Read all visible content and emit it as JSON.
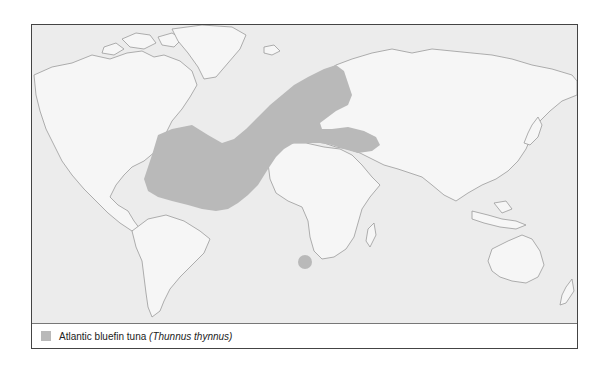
{
  "map": {
    "title": "Distribution map",
    "colors": {
      "ocean": "#ececec",
      "land": "#f6f6f6",
      "coast": "#9a9a9a",
      "range": "#b9b9b9",
      "frame": "#444444"
    },
    "ranges": [
      {
        "name": "north-atlantic-range",
        "label": "North Atlantic and Mediterranean range"
      },
      {
        "name": "south-africa-range",
        "label": "South African range spot"
      }
    ]
  },
  "legend": {
    "items": [
      {
        "common_name": "Atlantic bluefin tuna",
        "scientific_name": "(Thunnus thynnus)",
        "color": "#b9b9b9"
      }
    ]
  }
}
